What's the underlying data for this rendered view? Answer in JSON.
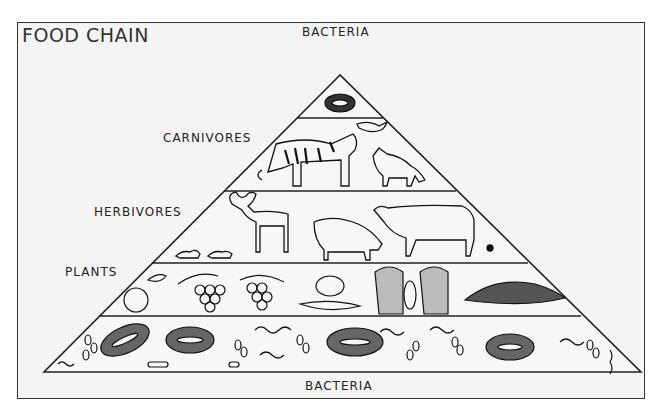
{
  "diagram": {
    "title": "FOOD CHAIN",
    "type": "trophic-pyramid",
    "top_label": "BACTERIA",
    "bottom_label": "BACTERIA",
    "levels": [
      {
        "label": "BACTERIA",
        "position": "apex",
        "contents": [
          "bacterium"
        ]
      },
      {
        "label": "CARNIVORES",
        "contents": [
          "tiger",
          "bird",
          "fox"
        ]
      },
      {
        "label": "HERBIVORES",
        "contents": [
          "mouse",
          "mouse",
          "deer",
          "pig",
          "cow",
          "insect"
        ]
      },
      {
        "label": "PLANTS",
        "contents": [
          "apple",
          "grapes",
          "vegetables",
          "wheat",
          "corn"
        ]
      },
      {
        "label": "",
        "position": "base",
        "contents": [
          "bacteria",
          "microorganisms"
        ]
      }
    ],
    "colors": {
      "line": "#222222",
      "background": "#f4f4f4",
      "text": "#222222"
    }
  }
}
